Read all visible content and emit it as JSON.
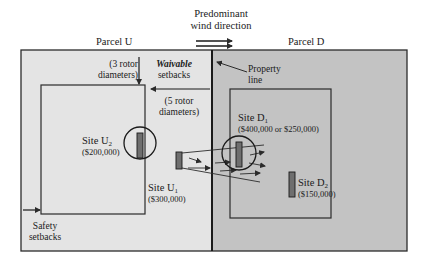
{
  "diagram": {
    "colors": {
      "parcel_u_fill": "#e4e4e4",
      "parcel_d_fill": "#c3c3c3",
      "line": "#2b2b2b",
      "turbine": "#6e6e6e"
    },
    "wind": {
      "label_line1": "Predominant",
      "label_line2": "wind direction"
    },
    "parcels": {
      "u": {
        "label": "Parcel U"
      },
      "d": {
        "label": "Parcel D"
      }
    },
    "property_line": {
      "label_line1": "Property",
      "label_line2": "line"
    },
    "setbacks": {
      "top_dist_line1": "(3 rotor",
      "top_dist_line2": "diameters)",
      "waivable_line1": "Waivable",
      "waivable_line2": "setbacks",
      "side_dist_line1": "(5 rotor",
      "side_dist_line2": "diameters)",
      "safety_line1": "Safety",
      "safety_line2": "setbacks"
    },
    "sites": {
      "u2": {
        "name": "Site U",
        "sub": "2",
        "value": "($200,000)"
      },
      "u1": {
        "name": "Site U",
        "sub": "1",
        "value": "($300,000)"
      },
      "d1": {
        "name": "Site D",
        "sub": "1",
        "value": "($400,000 or $250,000)"
      },
      "d2": {
        "name": "Site D",
        "sub": "2",
        "value": "($150,000)"
      }
    }
  }
}
